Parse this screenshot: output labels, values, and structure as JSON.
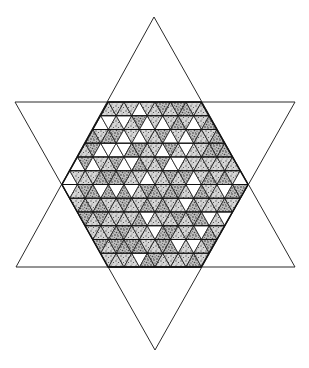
{
  "figure": {
    "colors": {
      "background": "#ffffff",
      "line": "#2a2a2a",
      "stipple_dark": "#3a3a3a",
      "stipple_light": "#9a9a9a"
    },
    "star": {
      "up_triangle": [
        [
          154,
          17
        ],
        [
          16,
          267
        ],
        [
          295,
          267
        ]
      ],
      "down_triangle": [
        [
          15,
          102
        ],
        [
          295,
          102
        ],
        [
          155,
          350
        ]
      ]
    },
    "hexagon": {
      "top_y": 102,
      "bottom_y": 267,
      "left_x": 62,
      "right_x": 248,
      "top_left_x": 108,
      "top_right_x": 201,
      "side_triangles": 6,
      "rows": 12
    },
    "shading": {
      "white_rule": "kagome",
      "note": "Stippled triangles dominate; white triangles form a recurring lattice pattern"
    }
  }
}
